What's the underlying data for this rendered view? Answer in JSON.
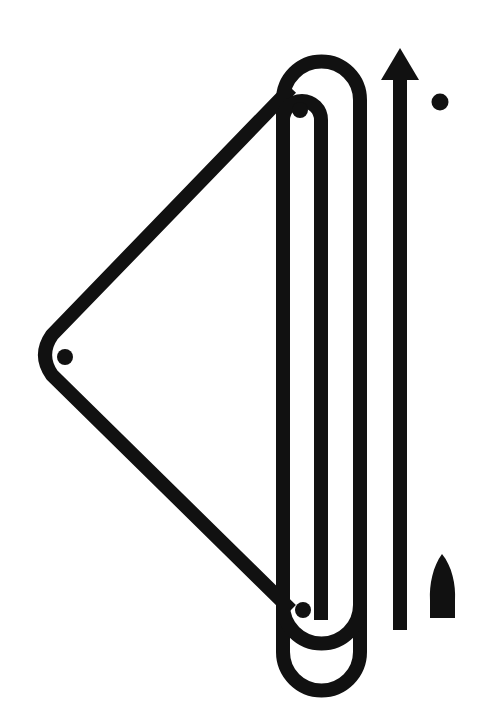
{
  "diagram": {
    "type": "sailing-course",
    "colors": {
      "ink": "#111111",
      "background": "#ffffff"
    },
    "marks": [
      {
        "id": "windward-mark",
        "x": 300,
        "y": 110
      },
      {
        "id": "wing-mark",
        "x": 65,
        "y": 357
      },
      {
        "id": "leeward-mark",
        "x": 303,
        "y": 610
      },
      {
        "id": "start-pin-mark",
        "x": 440,
        "y": 102
      }
    ],
    "wind_arrow": {
      "direction": "up"
    },
    "boat": {
      "x": 442,
      "y": 590
    }
  }
}
